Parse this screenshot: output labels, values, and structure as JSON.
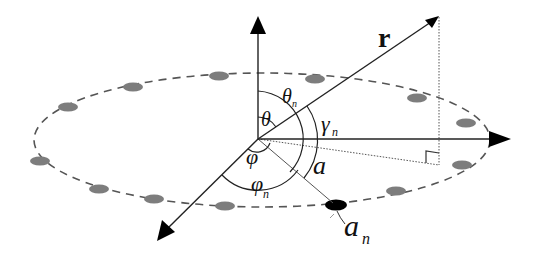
{
  "diagram": {
    "colors": {
      "axis": "#222222",
      "element": "#7a7a7a",
      "active_element": "#000000",
      "dashed_circle": "#555555",
      "dotted": "#555555"
    },
    "labels": {
      "r": "r",
      "theta": "θ",
      "theta_n": "θ",
      "theta_n_sub": "n",
      "gamma_n": "γ",
      "gamma_n_sub": "n",
      "phi": "φ",
      "phi_n": "φ",
      "phi_n_sub": "n",
      "a": "a",
      "a_n": "a",
      "a_n_sub": "n"
    },
    "axes": [
      "z-axis",
      "x-axis",
      "y-axis"
    ],
    "elements_count": 17,
    "highlighted_element": "a_n"
  }
}
